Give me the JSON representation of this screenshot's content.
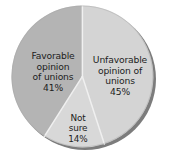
{
  "chart_data": {
    "type": "pie",
    "title": "",
    "subtitle": "",
    "xlabel": "",
    "ylabel": "",
    "legend_position": "none",
    "grid": false,
    "labels_inside_slices": true,
    "categories": [
      "Unfavorable opinion of unions",
      "Not sure",
      "Favorable opinion of unions"
    ],
    "values": [
      45,
      14,
      41
    ],
    "value_unit": "%",
    "slices": [
      {
        "name": "unfavorable",
        "label_line1": "Unfavorable",
        "label_line2": "opinion of",
        "label_line3": "unions",
        "label_text": "Unfavorable\nopinion of\nunions",
        "value": 45,
        "value_text": "45%",
        "color": "#d4d4d4",
        "start_angle_deg": 0,
        "end_angle_deg": 162
      },
      {
        "name": "not-sure",
        "label_line1": "Not",
        "label_line2": "sure",
        "label_text": "Not\nsure",
        "value": 14,
        "value_text": "14%",
        "color": "#d8d8d8",
        "start_angle_deg": 162,
        "end_angle_deg": 212.4
      },
      {
        "name": "favorable",
        "label_line1": "Favorable",
        "label_line2": "opinion",
        "label_line3": "of unions",
        "label_text": "Favorable\nopinion\nof unions",
        "value": 41,
        "value_text": "41%",
        "color": "#b4b4b4",
        "start_angle_deg": 212.4,
        "end_angle_deg": 360
      }
    ],
    "colors": {
      "background": "#ffffff",
      "slice_unfavorable": "#d4d4d4",
      "slice_not_sure": "#d8d8d8",
      "slice_favorable": "#b4b4b4",
      "shadow_rim": "#7c7c7c",
      "divider": "#f2f2f2",
      "label_text": "#1d1d1d"
    },
    "geometry": {
      "center_x": 85,
      "center_y": 79,
      "radius": 71,
      "rim_thickness": 7
    }
  }
}
